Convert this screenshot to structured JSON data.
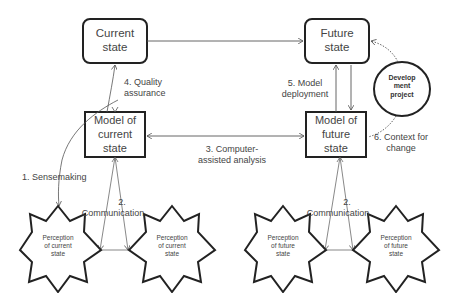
{
  "nodes": {
    "current_state": {
      "label": "Current state",
      "line1": "Current",
      "line2": "state"
    },
    "future_state": {
      "label": "Future state",
      "line1": "Future",
      "line2": "state"
    },
    "model_current": {
      "line1": "Model of",
      "line2": "current",
      "line3": "state"
    },
    "model_future": {
      "line1": "Model of",
      "line2": "future",
      "line3": "state"
    },
    "development_project": {
      "line1": "Develop",
      "line2": "ment",
      "line3": "project"
    },
    "perception_current_1": {
      "line1": "Perception",
      "line2": "of current",
      "line3": "state"
    },
    "perception_current_2": {
      "line1": "Perception",
      "line2": "of current",
      "line3": "state"
    },
    "perception_future_1": {
      "line1": "Perception",
      "line2": "of future",
      "line3": "state"
    },
    "perception_future_2": {
      "line1": "Perception",
      "line2": "of future",
      "line3": "state"
    }
  },
  "edges": {
    "sensemaking": {
      "label": "1. Sensemaking"
    },
    "communication_current": {
      "line1": "2.",
      "line2": "Communication"
    },
    "communication_future": {
      "line1": "2.",
      "line2": "Communication"
    },
    "computer_assisted": {
      "line1": "3. Computer-",
      "line2": "assisted analysis"
    },
    "quality_assurance": {
      "line1": "4. Quality",
      "line2": "assurance"
    },
    "model_deployment": {
      "line1": "5. Model",
      "line2": "deployment"
    },
    "context_for_change": {
      "line1": "6. Context for",
      "line2": "change"
    }
  },
  "colors": {
    "stroke": "#222222",
    "thin_stroke": "#555555",
    "text": "#444444"
  }
}
